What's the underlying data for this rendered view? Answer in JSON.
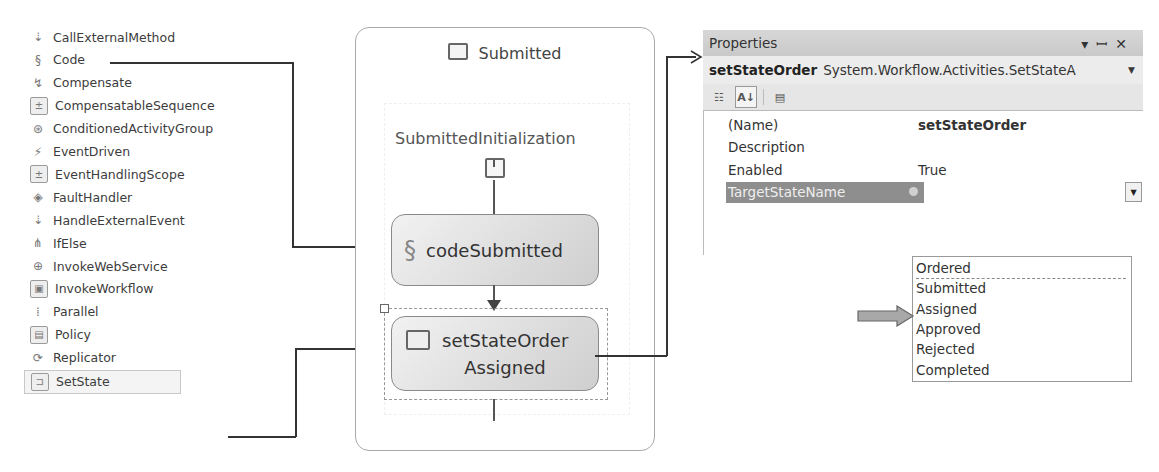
{
  "toolbox": {
    "items": [
      {
        "label": "CallExternalMethod",
        "icon": "call-external-method-icon",
        "glyph": "⇣"
      },
      {
        "label": "Code",
        "icon": "code-scroll-icon",
        "glyph": "§"
      },
      {
        "label": "Compensate",
        "icon": "compensate-icon",
        "glyph": "↯"
      },
      {
        "label": "CompensatableSequence",
        "icon": "compensatable-sequence-icon",
        "glyph": "±"
      },
      {
        "label": "ConditionedActivityGroup",
        "icon": "conditioned-activity-group-icon",
        "glyph": "⊛"
      },
      {
        "label": "EventDriven",
        "icon": "event-driven-icon",
        "glyph": "⚡"
      },
      {
        "label": "EventHandlingScope",
        "icon": "event-handling-scope-icon",
        "glyph": "±"
      },
      {
        "label": "FaultHandler",
        "icon": "fault-handler-icon",
        "glyph": "◈"
      },
      {
        "label": "HandleExternalEvent",
        "icon": "handle-external-event-icon",
        "glyph": "⇣"
      },
      {
        "label": "IfElse",
        "icon": "if-else-icon",
        "glyph": "⋔"
      },
      {
        "label": "InvokeWebService",
        "icon": "invoke-web-service-icon",
        "glyph": "⊕"
      },
      {
        "label": "InvokeWorkflow",
        "icon": "invoke-workflow-icon",
        "glyph": "▣"
      },
      {
        "label": "Parallel",
        "icon": "parallel-icon",
        "glyph": "⁞"
      },
      {
        "label": "Policy",
        "icon": "policy-icon",
        "glyph": "▤"
      },
      {
        "label": "Replicator",
        "icon": "replicator-icon",
        "glyph": "⟳"
      },
      {
        "label": "SetState",
        "icon": "set-state-icon",
        "glyph": "⊐",
        "selected": true
      }
    ]
  },
  "state": {
    "title": "Submitted",
    "initialization_label": "SubmittedInitialization",
    "activities": [
      {
        "name": "codeSubmitted",
        "icon": "code-scroll-icon"
      },
      {
        "name": "setStateOrder",
        "target": "Assigned",
        "icon": "set-state-icon"
      }
    ]
  },
  "properties": {
    "title": "Properties",
    "header_controls": [
      "▾",
      "ꟷ",
      "✕"
    ],
    "object_name": "setStateOrder",
    "object_type": "System.Workflow.Activities.SetStateA",
    "rows": [
      {
        "name": "(Name)",
        "value": "setStateOrder",
        "bold": true
      },
      {
        "name": "Description",
        "value": ""
      },
      {
        "name": "Enabled",
        "value": "True"
      },
      {
        "name": "TargetStateName",
        "value": "",
        "active": true
      }
    ],
    "dropdown_options": [
      "Ordered",
      "Submitted",
      "Assigned",
      "Approved",
      "Rejected",
      "Completed"
    ],
    "highlighted_option": "Assigned"
  }
}
